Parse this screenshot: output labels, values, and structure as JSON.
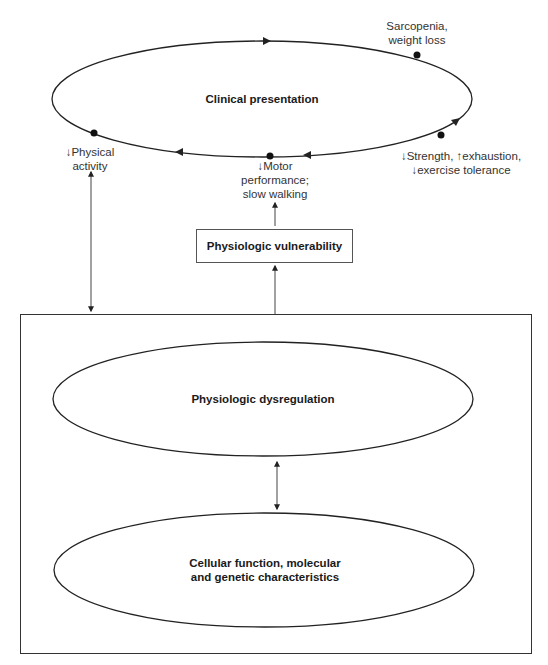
{
  "diagram": {
    "top_cycle": {
      "title": "Clinical presentation",
      "nodes": [
        {
          "id": "sarcopenia",
          "line1": "Sarcopenia,",
          "line2": "weight loss"
        },
        {
          "id": "strength",
          "line1": "↓Strength, ↑exhaustion,",
          "line2": "↓exercise tolerance"
        },
        {
          "id": "motor",
          "line1": "↓Motor",
          "line2": "performance;",
          "line3": "slow walking"
        },
        {
          "id": "activity",
          "line1": "↓Physical",
          "line2": "activity"
        }
      ]
    },
    "vulnerability_box": {
      "label": "Physiologic vulnerability"
    },
    "lower_panel": {
      "upper_ellipse": {
        "label": "Physiologic dysregulation"
      },
      "lower_ellipse": {
        "line1": "Cellular function, molecular",
        "line2": "and genetic characteristics"
      }
    },
    "colors": {
      "line": "#222222",
      "background": "#ffffff"
    }
  }
}
